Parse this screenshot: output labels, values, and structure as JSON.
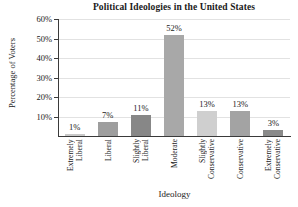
{
  "chart_data": {
    "type": "bar",
    "title": "Political Ideologies in the United States",
    "xlabel": "Ideology",
    "ylabel": "Percentage of Voters",
    "categories": [
      "Extremely Liberal",
      "Liberal",
      "Slightly Liberal",
      "Moderate",
      "Slightly Conservative",
      "Conservative",
      "Extremely Conservative"
    ],
    "category_lines": [
      [
        "Extremely",
        "Liberal"
      ],
      [
        "Liberal"
      ],
      [
        "Slightly",
        "Liberal"
      ],
      [
        "Moderate"
      ],
      [
        "Slightly",
        "Conservative"
      ],
      [
        "Conservative"
      ],
      [
        "Extremely",
        "Conservative"
      ]
    ],
    "values": [
      1,
      7,
      11,
      52,
      13,
      13,
      3
    ],
    "data_labels": [
      "1%",
      "7%",
      "11%",
      "52%",
      "13%",
      "13%",
      "3%"
    ],
    "bar_colors": [
      "#c9c9c9",
      "#9e9e9e",
      "#878787",
      "#a8a8a8",
      "#cfcfcf",
      "#a3a3a3",
      "#8a8a8a"
    ],
    "ylim": [
      0,
      60
    ],
    "ytick_values": [
      60,
      50,
      40,
      30,
      20,
      10
    ],
    "ytick_labels": [
      "60%",
      "50%",
      "40%",
      "30%",
      "20%",
      "10%"
    ],
    "grid": true,
    "grid_color": "#e2e2e2",
    "axis_color": "#3a3a3a",
    "legend": "none",
    "background": "#ffffff"
  }
}
